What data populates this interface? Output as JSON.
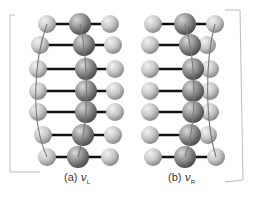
{
  "figure": {
    "panels": [
      {
        "id": "a",
        "label": "(a)",
        "symbol": "v",
        "subscript": "L",
        "rows_y": [
          24,
          45,
          69,
          91,
          112,
          135,
          157
        ],
        "left_x": [
          47,
          40,
          38,
          38,
          38,
          43,
          47
        ],
        "middle_x": [
          80,
          84,
          86,
          86,
          86,
          83,
          78
        ],
        "right_x": [
          110,
          113,
          115,
          115,
          115,
          113,
          110
        ],
        "curves": [
          "M47,24 C34,60 30,120 47,157",
          "M80,24 C88,60 90,120 78,157"
        ],
        "bracket": "M15,15 L10,15 L10,172 L40,172"
      },
      {
        "id": "b",
        "label": "(b)",
        "symbol": "v",
        "subscript": "R",
        "rows_y": [
          24,
          45,
          69,
          91,
          112,
          135,
          157
        ],
        "left_x": [
          153,
          150,
          150,
          150,
          150,
          150,
          153
        ],
        "middle_x": [
          185,
          190,
          193,
          193,
          193,
          190,
          185
        ],
        "right_x": [
          215,
          207,
          210,
          210,
          210,
          208,
          216
        ],
        "curves": [
          "M185,24 C196,60 198,120 185,157",
          "M215,24 C205,60 205,120 216,157"
        ],
        "bracket": "M225,10 L240,10 L243,180 L225,182"
      }
    ],
    "colors": {
      "atom_small": "#c8c8c8",
      "atom_large": "#8f8f8f",
      "bond": "#111111",
      "curve": "#777777",
      "bracket": "#bbbbbb"
    }
  }
}
